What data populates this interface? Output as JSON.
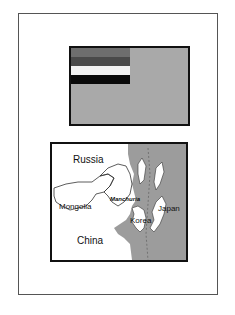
{
  "flag": {
    "colors": {
      "field": "#a9a9a9",
      "stripe1": "#6e6e6e",
      "stripe2": "#4a4a4a",
      "stripe3": "#f2f2f2",
      "stripe4": "#0a0a0a"
    }
  },
  "map": {
    "labels": {
      "russia": "Russia",
      "mongolia": "Mongolia",
      "manchuria": "Manchuria",
      "korea": "Korea",
      "japan": "Japan",
      "china": "China"
    },
    "colors": {
      "land_highlight": "#ffffff",
      "land_other": "#9c9c9c",
      "border": "#111111"
    }
  }
}
